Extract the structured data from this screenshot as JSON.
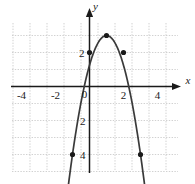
{
  "chart_data": {
    "type": "line",
    "title": "",
    "xlabel": "x",
    "ylabel": "y",
    "xlim": [
      -5.5,
      5.5
    ],
    "ylim": [
      -5.5,
      4.5
    ],
    "grid": true,
    "legend": null,
    "x_ticks": [
      -4,
      -2,
      0,
      2,
      4
    ],
    "x_tick_labels": [
      "-4",
      "-2",
      "0",
      "2",
      "4"
    ],
    "y_ticks": [
      2,
      -2,
      -4
    ],
    "y_tick_labels": [
      "2",
      "2",
      "4"
    ],
    "curve": {
      "name": "parabola",
      "equation": "y = -2x^2 + 4x + 2",
      "orientation": "opens-down",
      "vertex": [
        1,
        3
      ],
      "color": "#3a3a3a",
      "arrows": "both-ends-down",
      "x_range": [
        -1.35,
        3.35
      ]
    },
    "marked_points": [
      {
        "x": 0,
        "y": 2
      },
      {
        "x": 2,
        "y": 2
      },
      {
        "x": 1,
        "y": 3
      },
      {
        "x": -1,
        "y": -4
      },
      {
        "x": 3,
        "y": -4
      }
    ]
  },
  "axes": {
    "x_axis_label": "x",
    "y_axis_label": "y",
    "origin_label": "0"
  },
  "colors": {
    "grid": "#c9c9c9",
    "axis": "#1a1a1a",
    "curve": "#3a3a3a",
    "point": "#1a1a1a",
    "background": "#ffffff"
  }
}
